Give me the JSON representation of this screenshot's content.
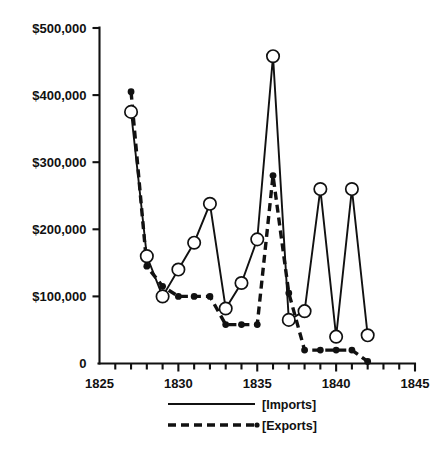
{
  "chart_data": {
    "type": "line",
    "title": "",
    "xlabel": "",
    "ylabel": "",
    "xlim": [
      1825,
      1845
    ],
    "ylim": [
      0,
      500000
    ],
    "grid": false,
    "legend_position": "bottom-center",
    "x": [
      1827,
      1828,
      1829,
      1830,
      1831,
      1832,
      1833,
      1834,
      1835,
      1836,
      1837,
      1838,
      1839,
      1840,
      1841,
      1842
    ],
    "series": [
      {
        "name": "[Imports]",
        "marker": "open-circle",
        "linestyle": "solid",
        "values": [
          375000,
          160000,
          100000,
          140000,
          180000,
          238000,
          82000,
          120000,
          185000,
          458000,
          65000,
          78000,
          260000,
          40000,
          260000,
          42000
        ]
      },
      {
        "name": "[Exports]",
        "marker": "filled-dot",
        "linestyle": "dashed",
        "values": [
          405000,
          145000,
          115000,
          100000,
          100000,
          100000,
          58000,
          58000,
          58000,
          280000,
          105000,
          20000,
          20000,
          20000,
          20000,
          3000
        ]
      }
    ],
    "y_ticks": [
      0,
      100000,
      200000,
      300000,
      400000,
      500000
    ],
    "y_tick_labels": [
      "0",
      "$100,000",
      "$200,000",
      "$300,000",
      "$400,000",
      "$500,000"
    ],
    "x_ticks": [
      1825,
      1830,
      1835,
      1840,
      1845
    ],
    "x_tick_labels": [
      "1825",
      "1830",
      "1835",
      "1840",
      "1845"
    ],
    "x_minor_ticks": [
      1826,
      1827,
      1828,
      1829,
      1831,
      1832,
      1833,
      1834,
      1836,
      1837,
      1838,
      1839,
      1841,
      1842,
      1843,
      1844
    ]
  },
  "axis": {
    "y_labels": [
      "$500,000",
      "$400,000",
      "$300,000",
      "$200,000",
      "$100,000",
      "0"
    ],
    "x_labels": [
      "1825",
      "1830",
      "1835",
      "1840",
      "1845"
    ]
  },
  "legend": {
    "items": [
      {
        "label": "[Imports]",
        "style": "solid"
      },
      {
        "label": "[Exports]",
        "style": "dashed"
      }
    ]
  },
  "colors": {
    "ink": "#111111",
    "background": "#ffffff"
  }
}
